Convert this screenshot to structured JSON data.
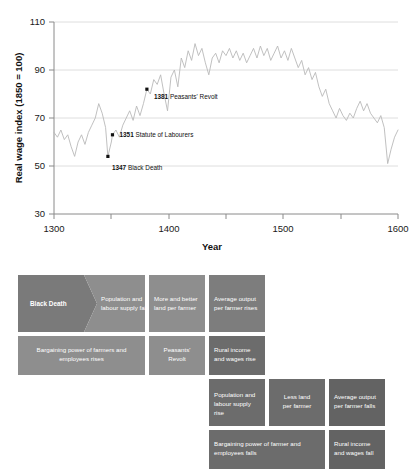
{
  "chart_data": {
    "type": "line",
    "title": "",
    "xlabel": "Year",
    "ylabel": "Real wage index (1850 = 100)",
    "xlim": [
      1300,
      1600
    ],
    "ylim": [
      30,
      110
    ],
    "xticks": [
      "1300",
      "1400",
      "1500",
      "1600"
    ],
    "xminorticks": [
      "1350",
      "1450",
      "1550"
    ],
    "yticks": [
      "30",
      "50",
      "70",
      "90",
      "110"
    ],
    "grid": "horizontal",
    "legend": "none",
    "series_name": "Real wage index",
    "series_color": "#b9b9b9",
    "x": [
      1300,
      1303,
      1306,
      1309,
      1312,
      1315,
      1318,
      1321,
      1324,
      1327,
      1330,
      1333,
      1336,
      1339,
      1342,
      1345,
      1347,
      1350,
      1351,
      1354,
      1357,
      1360,
      1363,
      1366,
      1369,
      1372,
      1375,
      1378,
      1381,
      1384,
      1387,
      1390,
      1393,
      1396,
      1399,
      1402,
      1405,
      1408,
      1411,
      1414,
      1417,
      1420,
      1423,
      1426,
      1429,
      1432,
      1435,
      1438,
      1441,
      1444,
      1447,
      1450,
      1453,
      1456,
      1459,
      1462,
      1465,
      1468,
      1471,
      1474,
      1477,
      1480,
      1483,
      1486,
      1489,
      1492,
      1495,
      1498,
      1501,
      1504,
      1507,
      1510,
      1513,
      1516,
      1519,
      1522,
      1525,
      1528,
      1531,
      1534,
      1537,
      1540,
      1543,
      1546,
      1549,
      1552,
      1555,
      1558,
      1561,
      1564,
      1567,
      1570,
      1573,
      1576,
      1579,
      1582,
      1585,
      1588,
      1591,
      1594,
      1597,
      1600
    ],
    "y": [
      64,
      62,
      65,
      61,
      63,
      58,
      54,
      60,
      63,
      59,
      64,
      67,
      70,
      76,
      72,
      66,
      54,
      60,
      63,
      65,
      62,
      67,
      70,
      73,
      69,
      75,
      71,
      76,
      82,
      80,
      86,
      84,
      88,
      80,
      73,
      87,
      90,
      83,
      95,
      91,
      98,
      94,
      101,
      96,
      99,
      93,
      88,
      95,
      97,
      93,
      98,
      96,
      99,
      95,
      98,
      94,
      97,
      93,
      96,
      99,
      95,
      100,
      96,
      99,
      94,
      97,
      100,
      95,
      98,
      94,
      99,
      95,
      91,
      94,
      88,
      91,
      86,
      89,
      83,
      79,
      82,
      76,
      73,
      70,
      74,
      71,
      69,
      72,
      70,
      74,
      77,
      73,
      76,
      72,
      70,
      68,
      71,
      66,
      51,
      57,
      62,
      65
    ],
    "annotations": [
      {
        "year": "1347",
        "label": "Black Death",
        "value": 54,
        "marker": true
      },
      {
        "year": "1351",
        "label": "Statute of Labourers",
        "value": 63,
        "marker": true
      },
      {
        "year": "1381",
        "label": "Peasants' Revolt",
        "value": 82,
        "marker": true
      }
    ]
  },
  "flow": {
    "rows": [
      {
        "id": "row-1",
        "boxes": [
          {
            "text": "Black Death",
            "shape": "chevron",
            "emphasis": "bold"
          },
          {
            "text": "Population and labour supply fall",
            "shape": "rect"
          },
          {
            "text": "More and better land per farmer",
            "shape": "rect"
          },
          {
            "text": "Average output per farmer rises",
            "shape": "rect"
          }
        ]
      },
      {
        "id": "row-2",
        "boxes": [
          {
            "text": "Bargaining power of farmers and employees rises",
            "shape": "rect"
          },
          {
            "text": "Peasants' Revolt",
            "shape": "rect"
          },
          {
            "text": "Rural income and wages rise",
            "shape": "rect"
          }
        ]
      },
      {
        "id": "row-3",
        "boxes": [
          {
            "text": "Population and labour supply rise",
            "shape": "rect"
          },
          {
            "text": "Less land per farmer",
            "shape": "rect"
          },
          {
            "text": "Average output per farmer falls",
            "shape": "rect"
          }
        ]
      },
      {
        "id": "row-4",
        "boxes": [
          {
            "text": "Bargaining power of farmer and employees falls",
            "shape": "rect"
          },
          {
            "text": "Rural income and wages fall",
            "shape": "rect"
          }
        ]
      }
    ]
  },
  "colors": {
    "box_light": "#8e8e8e",
    "box_mid": "#7d7d7d",
    "box_dark": "#6c6c6c",
    "box_darker": "#636363",
    "line": "#b9b9b9",
    "grid": "#d6d6d6",
    "text_on_box": "#ffffff"
  }
}
